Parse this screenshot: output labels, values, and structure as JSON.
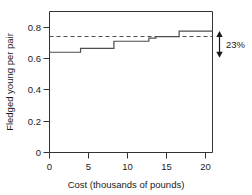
{
  "chart_data": {
    "type": "line",
    "title": "",
    "subtitle": "",
    "xlabel": "Cost (thousands of pounds)",
    "ylabel": "Fledged young per pair",
    "xlim": [
      0,
      21
    ],
    "ylim": [
      0,
      0.9
    ],
    "xticks": [
      0,
      5,
      10,
      15,
      20
    ],
    "xtick_labels": [
      "0",
      "5",
      "10",
      "15",
      "20"
    ],
    "yticks": [
      0,
      0.2,
      0.4,
      0.6,
      0.8
    ],
    "ytick_labels": [
      "0",
      "0.2",
      "0.4",
      "0.6",
      "0.8"
    ],
    "grid": false,
    "legend": null,
    "series": [
      {
        "name": "Fledged young per pair (step function)",
        "style": "step-solid",
        "color": "#4d4d4d",
        "x": [
          0,
          4.0,
          4.0,
          8.3,
          8.3,
          12.8,
          12.8,
          13.7,
          13.7,
          16.7,
          16.7,
          21
        ],
        "y": [
          0.64,
          0.64,
          0.665,
          0.665,
          0.71,
          0.71,
          0.73,
          0.73,
          0.74,
          0.74,
          0.775,
          0.775
        ],
        "steps": [
          {
            "x_start": 0.0,
            "x_end": 4.0,
            "value": 0.64
          },
          {
            "x_start": 4.0,
            "x_end": 8.3,
            "value": 0.665
          },
          {
            "x_start": 8.3,
            "x_end": 12.8,
            "value": 0.71
          },
          {
            "x_start": 12.8,
            "x_end": 13.7,
            "value": 0.73
          },
          {
            "x_start": 13.7,
            "x_end": 16.7,
            "value": 0.74
          },
          {
            "x_start": 16.7,
            "x_end": 21.0,
            "value": 0.775
          }
        ]
      },
      {
        "name": "Reference level (dashed)",
        "style": "dashed-horizontal",
        "color": "#4d4d4d",
        "x": [
          0,
          21
        ],
        "y": [
          0.74,
          0.74
        ]
      }
    ],
    "annotations": [
      {
        "name": "percent-difference",
        "label": "23%",
        "type": "double-arrow",
        "x": 21.4,
        "y_top": 0.775,
        "y_bottom": 0.605
      }
    ]
  },
  "axes": {
    "y_label": "Fledged young per pair",
    "x_label": "Cost (thousands of pounds)",
    "y_ticks": [
      "0.8",
      "0.6",
      "0.4",
      "0.2",
      "0"
    ],
    "x_ticks": [
      "0",
      "5",
      "10",
      "15",
      "20"
    ]
  },
  "annotation": {
    "percent_label": "23%"
  },
  "colors": {
    "line": "#4d4d4d",
    "axis": "#333333",
    "text": "#1a1a1a",
    "background": "#ffffff"
  }
}
